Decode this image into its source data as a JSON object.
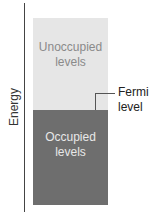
{
  "axis": {
    "label": "Energy"
  },
  "bands": {
    "unoccupied": {
      "line1": "Unoccupied",
      "line2": "levels",
      "color": "#e6e6e6"
    },
    "occupied": {
      "line1": "Occupied",
      "line2": "levels",
      "color": "#6e6e6e"
    }
  },
  "fermi": {
    "line1": "Fermi",
    "line2": "level"
  }
}
